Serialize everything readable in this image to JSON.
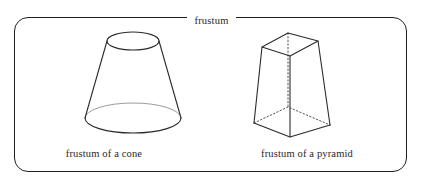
{
  "figure": {
    "frame_title": "frustum",
    "border_color": "#231f20",
    "ink_color": "#2c2a2b",
    "hidden_line_color": "#555355",
    "faint_line_color": "#9b9a9c",
    "background_color": "#ffffff",
    "text_color": "#2b2728"
  },
  "items": [
    {
      "id": "cone",
      "caption": "frustum of a cone",
      "shape": "conical-frustum",
      "visible_features": [
        "top-ellipse-open",
        "left-slant-edge",
        "right-slant-edge",
        "bottom-ellipse-front-arc-solid",
        "bottom-ellipse-back-arc-faint"
      ]
    },
    {
      "id": "pyramid",
      "caption": "frustum of a pyramid",
      "shape": "square-pyramidal-frustum",
      "visible_features": [
        "top-face-parallelogram",
        "four-lateral-edges",
        "bottom-face-front-edges-solid",
        "bottom-face-back-edges-dotted",
        "hidden-vertical-axis-dotted"
      ]
    }
  ]
}
